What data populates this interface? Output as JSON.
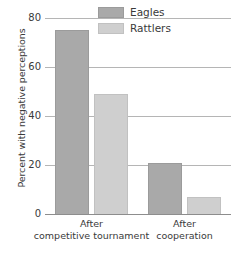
{
  "chart_data": {
    "type": "bar",
    "title": "",
    "xlabel": "",
    "ylabel": "Percent with negative perceptions",
    "ylim": [
      0,
      80
    ],
    "yticks": [
      0,
      20,
      40,
      60,
      80
    ],
    "ytick_labels": [
      "0",
      "20",
      "40",
      "60",
      "80"
    ],
    "grid": true,
    "legend_position": "top-right inside plot",
    "categories": [
      "After competitive tournament",
      "After cooperation"
    ],
    "category_lines": [
      [
        "After",
        "competitive tournament"
      ],
      [
        "After",
        "cooperation"
      ]
    ],
    "series": [
      {
        "name": "Eagles",
        "color": "#a9a9a9",
        "values": [
          75,
          21
        ]
      },
      {
        "name": "Rattlers",
        "color": "#cfcfcf",
        "values": [
          49,
          7
        ]
      }
    ]
  },
  "legend": {
    "entries": [
      {
        "label": "Eagles",
        "swatch": "eagles-swatch"
      },
      {
        "label": "Rattlers",
        "swatch": "rattlers-swatch"
      }
    ]
  },
  "colors": {
    "eagles": "#a9a9a9",
    "rattlers": "#cfcfcf",
    "gridline": "#b5b5b5",
    "axis": "#8d8d8d",
    "text": "#3a3a3a",
    "background": "#ffffff"
  }
}
